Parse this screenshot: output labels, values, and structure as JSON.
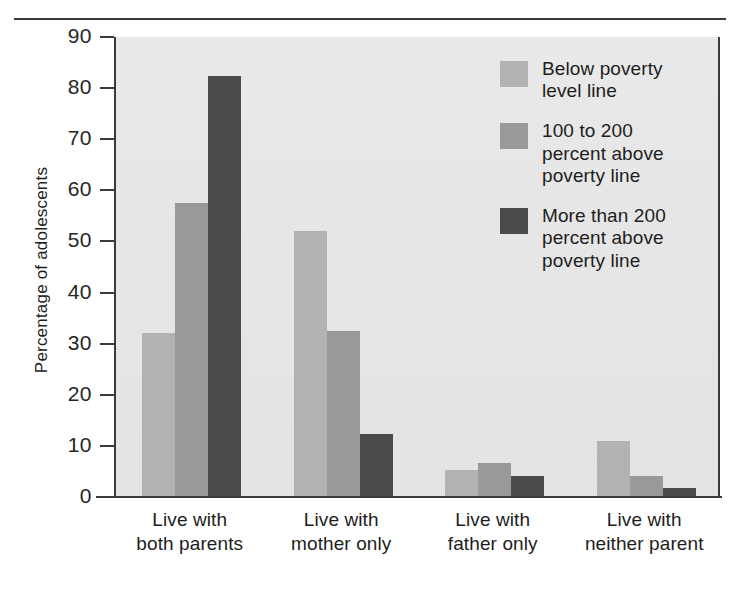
{
  "chart_data": {
    "type": "bar",
    "title": "",
    "subtitle": "",
    "xlabel": "",
    "ylabel": "Percentage of adolescents",
    "ylim": [
      0,
      90
    ],
    "ytick_values": [
      90,
      80,
      70,
      60,
      50,
      40,
      30,
      20,
      10,
      0
    ],
    "ytick_labels": [
      "90",
      "80",
      "70",
      "60",
      "50",
      "40",
      "30",
      "20",
      "10",
      "0"
    ],
    "grid": false,
    "legend_position": "inside-top-right",
    "categories": [
      "Live with\nboth parents",
      "Live with\nmother only",
      "Live with\nfather only",
      "Live with\nneither parent"
    ],
    "series": [
      {
        "name": "Below poverty\nlevel line",
        "color": "#b2b2b2",
        "values": [
          32,
          52,
          5.2,
          11
        ]
      },
      {
        "name": "100 to 200\npercent above\npoverty line",
        "color": "#999999",
        "values": [
          57.5,
          32.5,
          6.6,
          4.2
        ]
      },
      {
        "name": "More than 200\npercent above\npoverty line",
        "color": "#4a4a4a",
        "values": [
          82.4,
          12.3,
          4.1,
          1.7
        ]
      }
    ]
  },
  "legend": {
    "items": [
      {
        "label": "Below poverty\nlevel line",
        "color": "#b2b2b2"
      },
      {
        "label": "100 to 200\npercent above\npoverty line",
        "color": "#999999"
      },
      {
        "label": "More than 200\npercent above\npoverty line",
        "color": "#4a4a4a"
      }
    ]
  },
  "axes": {
    "y_title": "Percentage of adolescents",
    "x_title": ""
  },
  "style": {
    "plot_background": "#e7e7e7",
    "axis_color": "#3a3a3a",
    "text_color": "#1d1d1d"
  }
}
